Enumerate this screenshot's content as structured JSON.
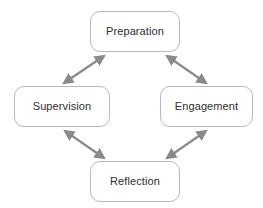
{
  "diagram": {
    "background_color": "#ffffff",
    "node_border_color": "#b8b8b8",
    "node_fill_color": "#ffffff",
    "node_text_color": "#2e2e2e",
    "arrow_color": "#8a8a8a",
    "nodes": [
      {
        "id": "preparation",
        "label": "Preparation"
      },
      {
        "id": "supervision",
        "label": "Supervision"
      },
      {
        "id": "engagement",
        "label": "Engagement"
      },
      {
        "id": "reflection",
        "label": "Reflection"
      }
    ],
    "edges": [
      {
        "id": "preparation-supervision",
        "from": "Preparation",
        "to": "Supervision",
        "direction": "bidirectional"
      },
      {
        "id": "preparation-engagement",
        "from": "Preparation",
        "to": "Engagement",
        "direction": "bidirectional"
      },
      {
        "id": "supervision-reflection",
        "from": "Supervision",
        "to": "Reflection",
        "direction": "bidirectional"
      },
      {
        "id": "engagement-reflection",
        "from": "Engagement",
        "to": "Reflection",
        "direction": "bidirectional"
      }
    ]
  }
}
